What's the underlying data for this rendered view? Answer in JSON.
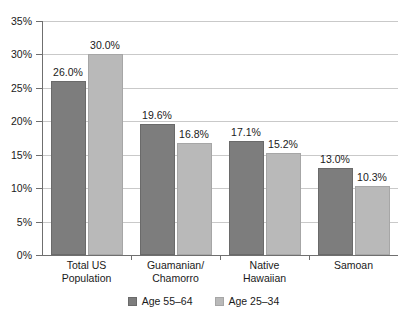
{
  "chart_data": {
    "type": "bar",
    "title": "",
    "subtitle": "",
    "xlabel": "",
    "ylabel": "",
    "categories": [
      "Total US Population",
      "Guamanian/ Chamorro",
      "Native Hawaiian",
      "Samoan"
    ],
    "category_lines": [
      [
        "Total US",
        "Population"
      ],
      [
        "Guamanian/",
        "Chamorro"
      ],
      [
        "Native",
        "Hawaiian"
      ],
      [
        "Samoan",
        ""
      ]
    ],
    "series": [
      {
        "name": "Age 55–64",
        "color": "#7d7d7d",
        "values": [
          26.0,
          19.6,
          17.1,
          13.0
        ],
        "labels": [
          "26.0%",
          "19.6%",
          "17.1%",
          "13.0%"
        ]
      },
      {
        "name": "Age 25–34",
        "color": "#b9b9b9",
        "values": [
          30.0,
          16.8,
          15.2,
          10.3
        ],
        "labels": [
          "30.0%",
          "16.8%",
          "15.2%",
          "10.3%"
        ]
      }
    ],
    "ylim": [
      0,
      35
    ],
    "ytick_values": [
      0,
      5,
      10,
      15,
      20,
      25,
      30,
      35
    ],
    "ytick_labels": [
      "0%",
      "5%",
      "10%",
      "15%",
      "20%",
      "25%",
      "30%",
      "35%"
    ],
    "grid": true,
    "legend_position": "bottom",
    "legend_entries": [
      "Age 55–64",
      "Age 25–34"
    ],
    "value_format": "percent"
  }
}
